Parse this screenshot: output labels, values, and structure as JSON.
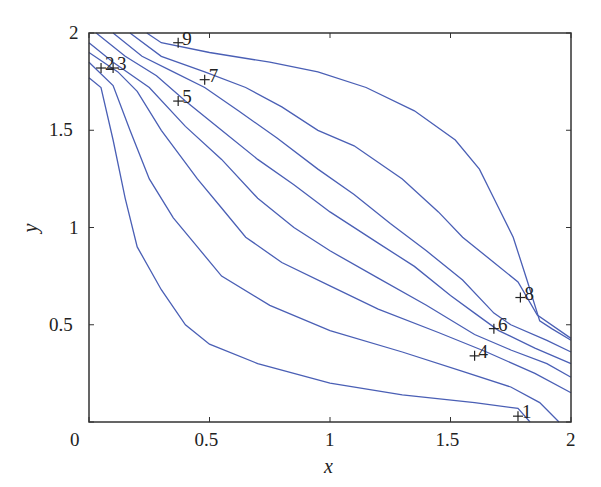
{
  "chart_data": {
    "type": "contour",
    "title": "",
    "xlabel": "x",
    "ylabel": "y",
    "xlim": [
      0,
      2
    ],
    "ylim": [
      0,
      2
    ],
    "grid": false,
    "legend": null,
    "line_color": "#4a5fb5",
    "xticks": [
      {
        "value": 0,
        "label": "0"
      },
      {
        "value": 0.5,
        "label": "0.5"
      },
      {
        "value": 1,
        "label": "1"
      },
      {
        "value": 1.5,
        "label": "1.5"
      },
      {
        "value": 2,
        "label": "2"
      }
    ],
    "yticks": [
      {
        "value": 0,
        "label": "0"
      },
      {
        "value": 0.5,
        "label": "0.5"
      },
      {
        "value": 1,
        "label": "1"
      },
      {
        "value": 1.5,
        "label": "1.5"
      },
      {
        "value": 2,
        "label": "2"
      }
    ],
    "contours": [
      {
        "points": [
          [
            0.0,
            1.77
          ],
          [
            0.05,
            1.72
          ],
          [
            0.1,
            1.45
          ],
          [
            0.15,
            1.15
          ],
          [
            0.2,
            0.9
          ],
          [
            0.3,
            0.68
          ],
          [
            0.4,
            0.5
          ],
          [
            0.5,
            0.4
          ],
          [
            0.7,
            0.3
          ],
          [
            1.0,
            0.2
          ],
          [
            1.3,
            0.14
          ],
          [
            1.6,
            0.1
          ],
          [
            1.78,
            0.07
          ],
          [
            1.83,
            0.0
          ]
        ]
      },
      {
        "points": [
          [
            0.0,
            1.85
          ],
          [
            0.1,
            1.73
          ],
          [
            0.17,
            1.5
          ],
          [
            0.25,
            1.25
          ],
          [
            0.35,
            1.05
          ],
          [
            0.45,
            0.9
          ],
          [
            0.55,
            0.75
          ],
          [
            0.75,
            0.6
          ],
          [
            1.0,
            0.47
          ],
          [
            1.3,
            0.36
          ],
          [
            1.55,
            0.26
          ],
          [
            1.75,
            0.18
          ],
          [
            1.87,
            0.1
          ],
          [
            1.95,
            0.0
          ]
        ]
      },
      {
        "points": [
          [
            0.0,
            1.9
          ],
          [
            0.12,
            1.8
          ],
          [
            0.2,
            1.7
          ],
          [
            0.3,
            1.5
          ],
          [
            0.45,
            1.25
          ],
          [
            0.55,
            1.1
          ],
          [
            0.65,
            0.95
          ],
          [
            0.8,
            0.82
          ],
          [
            1.0,
            0.7
          ],
          [
            1.2,
            0.58
          ],
          [
            1.45,
            0.46
          ],
          [
            1.65,
            0.36
          ],
          [
            1.85,
            0.25
          ],
          [
            2.0,
            0.15
          ]
        ]
      },
      {
        "points": [
          [
            0.0,
            1.95
          ],
          [
            0.1,
            1.85
          ],
          [
            0.25,
            1.72
          ],
          [
            0.4,
            1.52
          ],
          [
            0.55,
            1.35
          ],
          [
            0.7,
            1.15
          ],
          [
            0.85,
            1.0
          ],
          [
            1.0,
            0.88
          ],
          [
            1.2,
            0.74
          ],
          [
            1.4,
            0.6
          ],
          [
            1.6,
            0.45
          ],
          [
            1.75,
            0.37
          ],
          [
            1.9,
            0.3
          ],
          [
            2.0,
            0.23
          ]
        ]
      },
      {
        "points": [
          [
            0.03,
            2.0
          ],
          [
            0.15,
            1.88
          ],
          [
            0.28,
            1.78
          ],
          [
            0.4,
            1.65
          ],
          [
            0.55,
            1.5
          ],
          [
            0.7,
            1.35
          ],
          [
            0.85,
            1.22
          ],
          [
            1.0,
            1.08
          ],
          [
            1.2,
            0.92
          ],
          [
            1.35,
            0.8
          ],
          [
            1.5,
            0.65
          ],
          [
            1.6,
            0.56
          ],
          [
            1.7,
            0.47
          ],
          [
            1.85,
            0.38
          ],
          [
            2.0,
            0.3
          ]
        ]
      },
      {
        "points": [
          [
            0.1,
            2.0
          ],
          [
            0.22,
            1.88
          ],
          [
            0.35,
            1.8
          ],
          [
            0.48,
            1.72
          ],
          [
            0.62,
            1.6
          ],
          [
            0.78,
            1.46
          ],
          [
            0.95,
            1.3
          ],
          [
            1.1,
            1.17
          ],
          [
            1.25,
            1.02
          ],
          [
            1.4,
            0.88
          ],
          [
            1.55,
            0.73
          ],
          [
            1.68,
            0.56
          ],
          [
            1.75,
            0.5
          ],
          [
            1.9,
            0.42
          ],
          [
            2.0,
            0.36
          ]
        ]
      },
      {
        "points": [
          [
            0.17,
            2.0
          ],
          [
            0.3,
            1.88
          ],
          [
            0.48,
            1.8
          ],
          [
            0.65,
            1.72
          ],
          [
            0.8,
            1.62
          ],
          [
            0.95,
            1.5
          ],
          [
            1.1,
            1.42
          ],
          [
            1.3,
            1.25
          ],
          [
            1.45,
            1.08
          ],
          [
            1.55,
            0.95
          ],
          [
            1.68,
            0.82
          ],
          [
            1.78,
            0.72
          ],
          [
            1.86,
            0.55
          ],
          [
            2.0,
            0.43
          ]
        ]
      },
      {
        "points": [
          [
            0.24,
            2.0
          ],
          [
            0.3,
            1.95
          ],
          [
            0.5,
            1.9
          ],
          [
            0.75,
            1.85
          ],
          [
            0.95,
            1.8
          ],
          [
            1.15,
            1.72
          ],
          [
            1.35,
            1.6
          ],
          [
            1.52,
            1.45
          ],
          [
            1.62,
            1.3
          ],
          [
            1.7,
            1.1
          ],
          [
            1.76,
            0.95
          ],
          [
            1.82,
            0.72
          ],
          [
            1.87,
            0.52
          ],
          [
            1.92,
            0.48
          ],
          [
            2.0,
            0.42
          ]
        ]
      }
    ],
    "labels": [
      {
        "text": "1",
        "x": 1.78,
        "y": 0.03
      },
      {
        "text": "2",
        "x": 0.05,
        "y": 1.82
      },
      {
        "text": "3",
        "x": 0.1,
        "y": 1.82
      },
      {
        "text": "4",
        "x": 1.6,
        "y": 0.34
      },
      {
        "text": "5",
        "x": 0.37,
        "y": 1.65
      },
      {
        "text": "6",
        "x": 1.68,
        "y": 0.48
      },
      {
        "text": "7",
        "x": 0.48,
        "y": 1.76
      },
      {
        "text": "8",
        "x": 1.79,
        "y": 0.64
      },
      {
        "text": "9",
        "x": 0.37,
        "y": 1.95
      }
    ]
  },
  "layout": {
    "plot_left": 89,
    "plot_top": 33,
    "plot_right": 571,
    "plot_bottom": 422
  }
}
